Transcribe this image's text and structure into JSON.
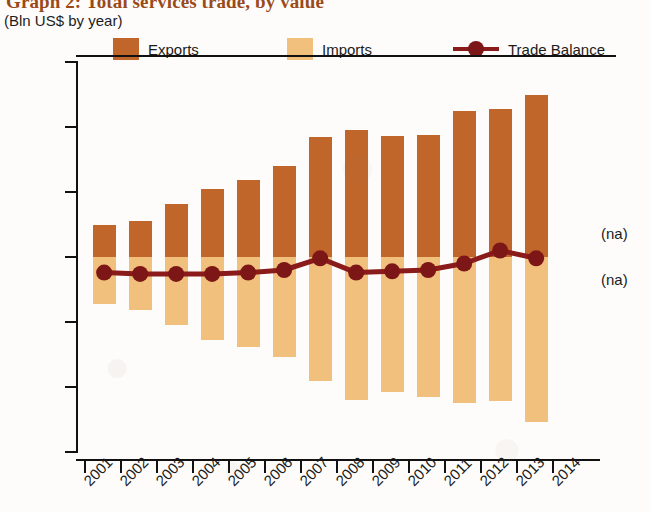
{
  "header": {
    "title": "Graph 2: Total services trade, by value",
    "subtitle": "(Bln US$ by year)"
  },
  "legend": {
    "items": [
      {
        "label": "Exports",
        "color": "#C0662A",
        "marker": "square"
      },
      {
        "label": "Imports",
        "color": "#F0C07C",
        "marker": "square"
      },
      {
        "label": "Trade Balance",
        "color": "#8B1A1A",
        "marker": "line-dot"
      }
    ]
  },
  "annotations": [
    {
      "text": "(na)",
      "position": "above-zero-right"
    },
    {
      "text": "(na)",
      "position": "below-zero-right"
    }
  ],
  "chart_data": {
    "type": "bar",
    "title": "Graph 2: Total services trade, by value",
    "subtitle": "(Bln US$ by year)",
    "xlabel": "",
    "ylabel": "Bln US$",
    "ylim": [
      -150,
      150
    ],
    "yticks": [
      150,
      100,
      50,
      0,
      -50,
      -100,
      -150
    ],
    "ytick_labels": [
      "150",
      "100",
      "50",
      "0",
      "-50",
      "-100",
      "-150"
    ],
    "categories": [
      "2001",
      "2002",
      "2003",
      "2004",
      "2005",
      "2006",
      "2007",
      "2008",
      "2009",
      "2010",
      "2011",
      "2012",
      "2013"
    ],
    "xtick_labels": [
      "2001",
      "2002",
      "2003",
      "2004",
      "2005",
      "2006",
      "2007",
      "2008",
      "2009",
      "2010",
      "2011",
      "2012",
      "2013",
      "2014"
    ],
    "grid": false,
    "legend_position": "top",
    "series": [
      {
        "name": "Exports",
        "type": "bar",
        "color": "#C0662A",
        "values": [
          25,
          28,
          41,
          52,
          59,
          70,
          92,
          98,
          93,
          94,
          112,
          114,
          125
        ]
      },
      {
        "name": "Imports",
        "type": "bar",
        "color": "#F0C07C",
        "values": [
          -36,
          -41,
          -52,
          -64,
          -69,
          -77,
          -95,
          -110,
          -104,
          -108,
          -112,
          -111,
          -127
        ]
      },
      {
        "name": "Trade Balance",
        "type": "line",
        "color": "#8B1A1A",
        "values": [
          -12,
          -13,
          -13,
          -13,
          -12,
          -10,
          -1,
          -12,
          -11,
          -10,
          -5,
          5,
          -1
        ]
      }
    ]
  }
}
